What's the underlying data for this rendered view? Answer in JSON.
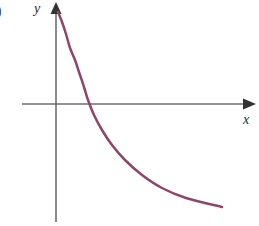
{
  "figure": {
    "background_color": "#ffffff",
    "width": 259,
    "height": 226,
    "item_marker": ")",
    "axis_color": "#6e6e6e",
    "arrowhead_color": "#333333",
    "curve_color": "#8e4668",
    "label_color": "#2b2b2b"
  },
  "axes": {
    "y_label": "y",
    "x_label": "x",
    "origin": {
      "x": 56,
      "y": 104
    },
    "x_axis": {
      "start_x": 22,
      "end_x": 256,
      "y": 104
    },
    "y_axis": {
      "x": 56,
      "start_y": 3,
      "end_y": 222
    }
  },
  "chart_data": {
    "type": "line",
    "title": "",
    "xlabel": "x",
    "ylabel": "y",
    "grid": false,
    "legend": null,
    "xlim": [
      -0.6,
      4.2
    ],
    "ylim": [
      -2.2,
      2.4
    ],
    "series": [
      {
        "name": "curve",
        "color": "#8e4668",
        "line_width": 2.5,
        "x": [
          0.03,
          0.1,
          0.2,
          0.32,
          0.45,
          0.6,
          0.8,
          1.0,
          1.25,
          1.55,
          1.9,
          2.3,
          2.75,
          3.2,
          3.6,
          4.0
        ],
        "y": [
          2.1,
          1.72,
          1.36,
          1.04,
          0.78,
          0.54,
          0.28,
          0.08,
          -0.14,
          -0.37,
          -0.6,
          -0.84,
          -1.1,
          -1.35,
          -1.55,
          -1.75
        ],
        "pixel_points": [
          [
            58,
            12
          ],
          [
            62,
            22
          ],
          [
            66,
            34
          ],
          [
            70,
            48
          ],
          [
            75,
            60
          ],
          [
            79,
            72
          ],
          [
            84,
            87
          ],
          [
            88,
            100
          ],
          [
            94,
            115
          ],
          [
            102,
            130
          ],
          [
            112,
            145
          ],
          [
            125,
            160
          ],
          [
            142,
            175
          ],
          [
            162,
            188
          ],
          [
            186,
            198
          ],
          [
            222,
            207
          ]
        ]
      }
    ],
    "x_axis_crossing": {
      "x": 1.05,
      "pixel_x": 87
    }
  }
}
